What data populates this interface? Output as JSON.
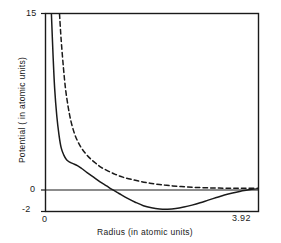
{
  "chart_data": {
    "type": "line",
    "title": "",
    "xlabel": "Radius (in atomic units)",
    "ylabel": "Potential ( in atomic units)",
    "xlim": [
      0,
      3.92
    ],
    "ylim": [
      -2,
      15
    ],
    "xticks": [
      0,
      3.92
    ],
    "xticklabels": [
      "0",
      "3.92"
    ],
    "yticks": [
      -2,
      0,
      15
    ],
    "yticklabels": [
      "-2",
      "0",
      "15"
    ],
    "grid": false,
    "legend": "none",
    "zero_line": 0,
    "series": [
      {
        "name": "solid-curve",
        "style": "solid",
        "color": "#1a1a1a",
        "points": [
          [
            0.1,
            15.0
          ],
          [
            0.13,
            11.5
          ],
          [
            0.16,
            8.6
          ],
          [
            0.2,
            6.2
          ],
          [
            0.24,
            4.6
          ],
          [
            0.28,
            3.5
          ],
          [
            0.33,
            2.85
          ],
          [
            0.38,
            2.45
          ],
          [
            0.44,
            2.25
          ],
          [
            0.5,
            2.12
          ],
          [
            0.58,
            1.95
          ],
          [
            0.66,
            1.7
          ],
          [
            0.76,
            1.35
          ],
          [
            0.88,
            0.95
          ],
          [
            1.0,
            0.55
          ],
          [
            1.12,
            0.2
          ],
          [
            1.22,
            -0.1
          ],
          [
            1.35,
            -0.45
          ],
          [
            1.5,
            -0.85
          ],
          [
            1.65,
            -1.2
          ],
          [
            1.8,
            -1.5
          ],
          [
            1.95,
            -1.68
          ],
          [
            2.1,
            -1.78
          ],
          [
            2.25,
            -1.8
          ],
          [
            2.4,
            -1.75
          ],
          [
            2.55,
            -1.62
          ],
          [
            2.7,
            -1.45
          ],
          [
            2.85,
            -1.25
          ],
          [
            3.0,
            -1.02
          ],
          [
            3.15,
            -0.8
          ],
          [
            3.3,
            -0.58
          ],
          [
            3.45,
            -0.4
          ],
          [
            3.6,
            -0.25
          ],
          [
            3.75,
            -0.12
          ],
          [
            3.92,
            -0.04
          ]
        ]
      },
      {
        "name": "dashed-curve",
        "style": "dashed",
        "color": "#1a1a1a",
        "points": [
          [
            0.25,
            15.0
          ],
          [
            0.28,
            12.8
          ],
          [
            0.32,
            10.5
          ],
          [
            0.36,
            8.6
          ],
          [
            0.41,
            7.0
          ],
          [
            0.46,
            5.8
          ],
          [
            0.52,
            4.8
          ],
          [
            0.58,
            4.1
          ],
          [
            0.65,
            3.5
          ],
          [
            0.73,
            3.0
          ],
          [
            0.82,
            2.55
          ],
          [
            0.92,
            2.15
          ],
          [
            1.02,
            1.8
          ],
          [
            1.15,
            1.48
          ],
          [
            1.28,
            1.2
          ],
          [
            1.42,
            0.96
          ],
          [
            1.58,
            0.76
          ],
          [
            1.75,
            0.58
          ],
          [
            1.92,
            0.44
          ],
          [
            2.1,
            0.32
          ],
          [
            2.3,
            0.22
          ],
          [
            2.5,
            0.15
          ],
          [
            2.7,
            0.09
          ],
          [
            2.9,
            0.05
          ],
          [
            3.1,
            0.02
          ],
          [
            3.3,
            0.01
          ],
          [
            3.5,
            0.0
          ],
          [
            3.7,
            0.0
          ],
          [
            3.92,
            0.0
          ]
        ]
      }
    ]
  }
}
